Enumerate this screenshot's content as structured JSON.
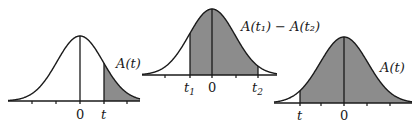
{
  "diagram": {
    "type": "normal-distribution-areas",
    "colors": {
      "shade": "#8c8c8c",
      "stroke": "#1a1a1a",
      "background": "#ffffff"
    },
    "panels": [
      {
        "id": "right-tail",
        "area_label": "A(t)",
        "axis_labels": {
          "zero": "0",
          "t": "t"
        },
        "shaded": "right of t"
      },
      {
        "id": "between",
        "area_label": "A(t₁) − A(t₂)",
        "axis_labels": {
          "zero": "0",
          "t1": "t",
          "t1_sub": "1",
          "t2": "t",
          "t2_sub": "2"
        },
        "shaded": "between t1 and t2"
      },
      {
        "id": "right-of-negative-t",
        "area_label": "A(t)",
        "axis_labels": {
          "zero": "0",
          "t": "t"
        },
        "shaded": "right of t"
      }
    ]
  }
}
